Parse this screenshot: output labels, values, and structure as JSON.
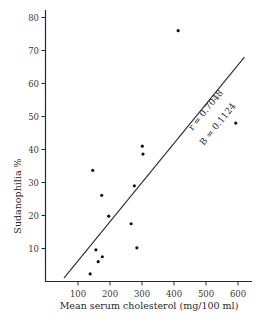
{
  "chart_data": {
    "type": "scatter",
    "title": "",
    "xlabel": "Mean serum cholesterol (mg/100 ml)",
    "ylabel": "Sudanophilia %",
    "xlim": [
      0,
      650
    ],
    "ylim": [
      0,
      82
    ],
    "x_ticks": [
      100,
      200,
      300,
      400,
      500,
      600
    ],
    "y_ticks": [
      10,
      20,
      30,
      40,
      50,
      60,
      70,
      80
    ],
    "grid": false,
    "legend": null,
    "series": [
      {
        "name": "observations",
        "points": [
          {
            "x": 413,
            "y": 76
          },
          {
            "x": 301,
            "y": 41
          },
          {
            "x": 303,
            "y": 38.6
          },
          {
            "x": 593,
            "y": 48
          },
          {
            "x": 146,
            "y": 33.7
          },
          {
            "x": 174,
            "y": 26.1
          },
          {
            "x": 276,
            "y": 29
          },
          {
            "x": 196,
            "y": 19.8
          },
          {
            "x": 266,
            "y": 17.5
          },
          {
            "x": 156,
            "y": 9.6
          },
          {
            "x": 284,
            "y": 10.2
          },
          {
            "x": 176,
            "y": 7.5
          },
          {
            "x": 163,
            "y": 6
          },
          {
            "x": 138,
            "y": 2.3
          }
        ]
      }
    ],
    "regression_line": {
      "x1": 56,
      "y1": 1,
      "x2": 620,
      "y2": 68
    },
    "annotations": [
      "r = 0.7048",
      "B = 0.1124"
    ]
  },
  "labels": {
    "xlabel": "Mean serum cholesterol (mg/100 ml)",
    "ylabel": "Sudanophilia %",
    "r_text": "r = 0.7048",
    "b_text": "B = 0.1124"
  }
}
